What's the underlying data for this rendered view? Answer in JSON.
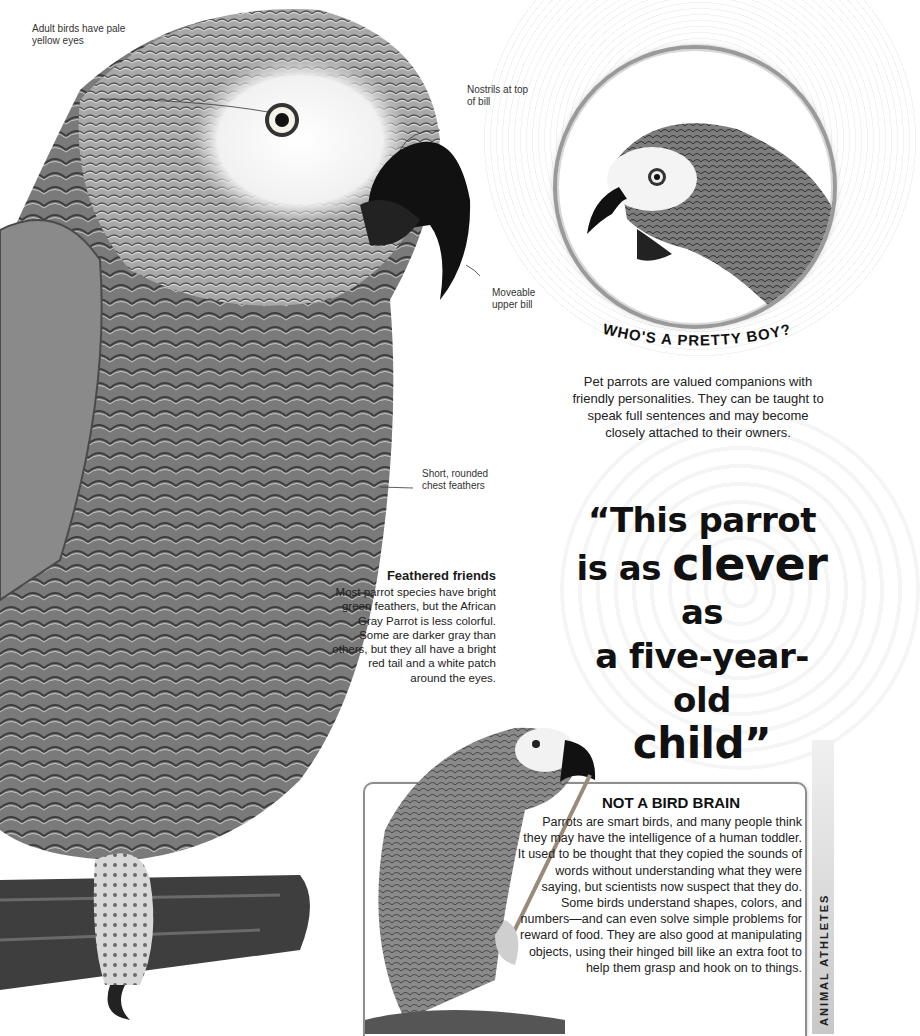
{
  "main_illustration": {
    "subject": "African Gray Parrot perched on branch",
    "labels": [
      {
        "id": "eyes",
        "text": "Adult birds have pale yellow eyes"
      },
      {
        "id": "nostrils",
        "text": "Nostrils at top of bill"
      },
      {
        "id": "bill",
        "text": "Moveable upper bill"
      },
      {
        "id": "chest",
        "text": "Short, rounded chest feathers"
      }
    ]
  },
  "pretty_boy": {
    "title": "WHO'S A PRETTY BOY?",
    "text": "Pet parrots are valued companions with friendly personalities. They can be taught to speak full sentences and may become closely attached to their owners."
  },
  "quote": {
    "line1": "“This parrot",
    "line2_pre": "is as ",
    "line2_big": "clever",
    "line2_post": " as",
    "line3": "a five-year-old",
    "line4": "child”"
  },
  "feathered_friends": {
    "heading": "Feathered friends",
    "text": "Most parrot species have bright green feathers, but the African Gray Parrot is less colorful. Some are darker gray than others, but they all have a bright red tail and a white patch around the eyes."
  },
  "bird_brain": {
    "heading": "NOT A BIRD BRAIN",
    "text": "Parrots are smart birds, and many people think they may have the intelligence of a human toddler. It used to be thought that they copied the sounds of words without understanding what they were saying, but scientists now suspect that they do. Some birds understand shapes, colors, and numbers—and can even solve simple problems for reward of food. They are also good at manipulating objects, using their hinged bill like an extra foot to help them grasp and hook on to things."
  },
  "side_tab": {
    "label": "ANIMAL ATHLETES"
  },
  "colors": {
    "border": "#8e8e8e",
    "text": "#1a1a1a",
    "circle_ring": "#9a9a9a"
  }
}
